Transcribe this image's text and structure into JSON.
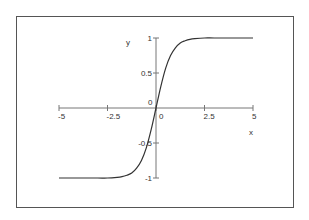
{
  "chart_data": {
    "type": "line",
    "title": "",
    "xlabel": "x",
    "ylabel": "y",
    "xlim": [
      -5,
      5
    ],
    "ylim": [
      -1,
      1
    ],
    "grid": false,
    "legend": null,
    "x_ticks": [
      "-5",
      "-2.5",
      "0",
      "2.5",
      "5"
    ],
    "y_ticks": [
      "1",
      "0.5",
      "0",
      "-0.5",
      "-1"
    ],
    "series": [
      {
        "name": "y",
        "color": "#333333",
        "x": [
          -5,
          -4,
          -3,
          -2.5,
          -2,
          -1.75,
          -1.5,
          -1.25,
          -1,
          -0.75,
          -0.5,
          -0.25,
          0,
          0.25,
          0.5,
          0.75,
          1,
          1.25,
          1.5,
          1.75,
          2,
          2.5,
          3,
          4,
          5
        ],
        "y": [
          -1.0,
          -1.0,
          -1.0,
          -1.0,
          -0.99,
          -0.98,
          -0.96,
          -0.93,
          -0.86,
          -0.75,
          -0.57,
          -0.31,
          0.0,
          0.31,
          0.57,
          0.75,
          0.86,
          0.93,
          0.96,
          0.98,
          0.99,
          1.0,
          1.0,
          1.0,
          1.0
        ]
      }
    ]
  }
}
